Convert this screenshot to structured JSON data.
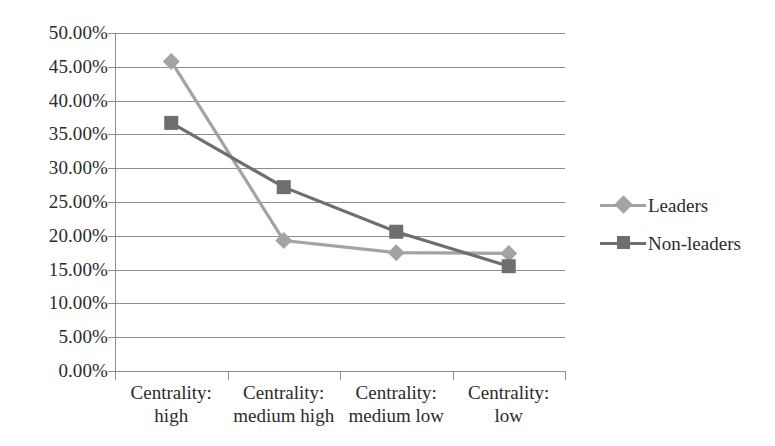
{
  "chart_data": {
    "type": "line",
    "title": "",
    "xlabel": "",
    "ylabel": "",
    "categories": [
      "Centrality: high",
      "Centrality: medium high",
      "Centrality: medium low",
      "Centrality: low"
    ],
    "category_lines": [
      [
        "Centrality:",
        "high"
      ],
      [
        "Centrality:",
        "medium high"
      ],
      [
        "Centrality:",
        "medium low"
      ],
      [
        "Centrality:",
        "low"
      ]
    ],
    "series": [
      {
        "name": "Leaders",
        "color": "#a3a3a3",
        "marker": "diamond",
        "values": [
          45.8,
          19.3,
          17.5,
          17.4
        ]
      },
      {
        "name": "Non-leaders",
        "color": "#6e6e6e",
        "marker": "square",
        "values": [
          36.7,
          27.2,
          20.6,
          15.5
        ]
      }
    ],
    "ylim": [
      0,
      50
    ],
    "ytick_values": [
      0,
      5,
      10,
      15,
      20,
      25,
      30,
      35,
      40,
      45,
      50
    ],
    "ytick_labels": [
      "0.00%",
      "5.00%",
      "10.00%",
      "15.00%",
      "20.00%",
      "25.00%",
      "30.00%",
      "35.00%",
      "40.00%",
      "45.00%",
      "50.00%"
    ],
    "grid": true,
    "legend_position": "right",
    "axis_color": "#8d8d8d",
    "background": "#ffffff"
  }
}
